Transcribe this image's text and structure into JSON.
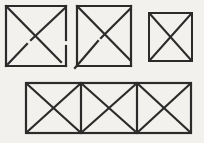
{
  "canvas": {
    "width": 204,
    "height": 143,
    "background_color": "#f2f1ee",
    "stroke_color": "#2b2b2b",
    "title": "Four line figures: three squares with diagonals and one subdivided rectangle"
  },
  "figures": [
    {
      "id": "figure-1",
      "label": "Square with crossed diagonals (irregular, offset crossing)",
      "shape": "square-with-x",
      "x": 5,
      "y": 5,
      "width": 62,
      "height": 62,
      "stroke_width": 2.2,
      "notes": "Hand-drawn: diagonals do not meet at a single point; small gap on right edge."
    },
    {
      "id": "figure-2",
      "label": "Square with crossed diagonals (irregular, overshooting diagonal)",
      "shape": "square-with-x",
      "x": 76,
      "y": 5,
      "width": 56,
      "height": 62,
      "stroke_width": 2.2,
      "notes": "Hand-drawn: lower-left diagonal overshoots past the corner."
    },
    {
      "id": "figure-3",
      "label": "Square with crossed diagonals (regular)",
      "shape": "square-with-x",
      "x": 148,
      "y": 12,
      "width": 45,
      "height": 50,
      "stroke_width": 2.0,
      "notes": "Clean square, diagonals cross at the center."
    },
    {
      "id": "figure-4",
      "label": "Rectangle divided into three cells, each with crossed diagonals",
      "shape": "rectangle-three-cells-with-x",
      "x": 25,
      "y": 82,
      "width": 167,
      "height": 52,
      "cells": 3,
      "divider_x": [
        81,
        137
      ],
      "stroke_width": 2.2,
      "notes": "Three square cells side by side, vertical dividers, X in each cell."
    }
  ],
  "counts": {
    "total_figures": 4,
    "top_row_figures": 3,
    "bottom_row_figures": 1,
    "bottom_cells": 3
  }
}
